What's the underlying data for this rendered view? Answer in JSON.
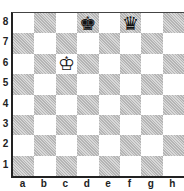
{
  "diagram": {
    "type": "chess-board",
    "ranks": [
      "8",
      "7",
      "6",
      "5",
      "4",
      "3",
      "2",
      "1"
    ],
    "files": [
      "a",
      "b",
      "c",
      "d",
      "e",
      "f",
      "g",
      "h"
    ],
    "pieces": [
      {
        "square": "d8",
        "glyph": "♚",
        "name": "black-king"
      },
      {
        "square": "f8",
        "glyph": "♛",
        "name": "black-queen"
      },
      {
        "square": "c6",
        "glyph": "♔",
        "name": "white-king"
      }
    ],
    "colors": {
      "light": "#ffffff",
      "dark": "#c8c8c8",
      "border": "#222222"
    }
  }
}
